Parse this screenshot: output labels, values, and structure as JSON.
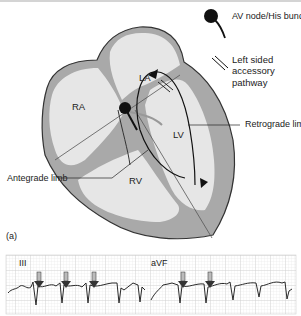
{
  "figure": {
    "panel_label": "(a)",
    "chambers": {
      "ra": "RA",
      "la": "LA",
      "lv": "LV",
      "rv": "RV"
    },
    "annotations": {
      "retrograde_limb": "Retrograde limb",
      "antegrade_limb": "Antegrade limb"
    },
    "legend": {
      "av_node": "AV node/His bundle",
      "accessory_pathway_line1": "Left sided accessory",
      "accessory_pathway_line2": "pathway"
    },
    "ecg": {
      "leads": [
        "III",
        "aVF"
      ],
      "arrow_count_lead_iii": 3,
      "arrow_count_lead_avf": 2
    },
    "colors": {
      "wall": "#a9a9a9",
      "chamber": "#e6e6e6",
      "outline": "#333333",
      "grid": "#c8c8c8",
      "trace": "#2a2a2a"
    }
  }
}
